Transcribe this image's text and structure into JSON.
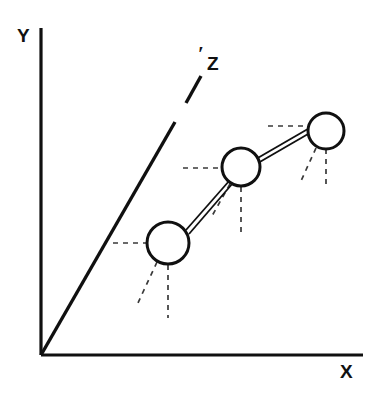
{
  "figure": {
    "background_color": "#ffffff",
    "ink_color": "#101010",
    "dash_color": "#3a3a3a",
    "width": 382,
    "height": 395
  },
  "labels": {
    "x_axis": "X",
    "y_axis": "Y",
    "z_axis": "Z",
    "z_axis_prime": "′"
  },
  "axes": {
    "origin": {
      "x": 41,
      "y": 355
    },
    "x_axis": {
      "from": {
        "x": 41,
        "y": 355
      },
      "to": {
        "x": 363,
        "y": 355
      }
    },
    "y_axis": {
      "from": {
        "x": 41,
        "y": 355
      },
      "to": {
        "x": 41,
        "y": 28
      }
    },
    "z_axis_segments": [
      {
        "from": {
          "x": 41,
          "y": 355
        },
        "to": {
          "x": 175,
          "y": 122
        }
      },
      {
        "from": {
          "x": 186,
          "y": 103
        },
        "to": {
          "x": 201,
          "y": 76
        }
      }
    ]
  },
  "atoms": [
    {
      "name": "atom-1",
      "cx": 168,
      "cy": 243,
      "r": 21
    },
    {
      "name": "atom-2",
      "cx": 241,
      "cy": 167,
      "r": 19
    },
    {
      "name": "atom-3",
      "cx": 326,
      "cy": 131,
      "r": 18
    }
  ],
  "bonds": [
    {
      "name": "bond-1-2",
      "line_a": {
        "x1": 186,
        "y1": 230,
        "x2": 237,
        "y2": 172
      },
      "line_b": {
        "x1": 189,
        "y1": 234,
        "x2": 239,
        "y2": 176
      }
    },
    {
      "name": "bond-2-3",
      "line_a": {
        "x1": 256,
        "y1": 159,
        "x2": 313,
        "y2": 126
      },
      "line_b": {
        "x1": 258,
        "y1": 163,
        "x2": 315,
        "y2": 130
      }
    }
  ],
  "dashed_rays": [
    {
      "name": "atom-1-ray-horizontal",
      "x1": 113,
      "y1": 243,
      "x2": 147,
      "y2": 243
    },
    {
      "name": "atom-1-ray-vertical",
      "x1": 168,
      "y1": 265,
      "x2": 168,
      "y2": 318
    },
    {
      "name": "atom-1-ray-diagonal",
      "x1": 157,
      "y1": 262,
      "x2": 137,
      "y2": 305
    },
    {
      "name": "atom-2-ray-horizontal",
      "x1": 183,
      "y1": 168,
      "x2": 222,
      "y2": 168
    },
    {
      "name": "atom-2-ray-vertical",
      "x1": 241,
      "y1": 187,
      "x2": 241,
      "y2": 233
    },
    {
      "name": "atom-2-ray-diagonal",
      "x1": 230,
      "y1": 184,
      "x2": 212,
      "y2": 216
    },
    {
      "name": "atom-3-ray-horizontal",
      "x1": 268,
      "y1": 126,
      "x2": 306,
      "y2": 126
    },
    {
      "name": "atom-3-ray-vertical",
      "x1": 326,
      "y1": 149,
      "x2": 326,
      "y2": 184
    },
    {
      "name": "atom-3-ray-diagonal",
      "x1": 316,
      "y1": 148,
      "x2": 301,
      "y2": 181
    }
  ]
}
